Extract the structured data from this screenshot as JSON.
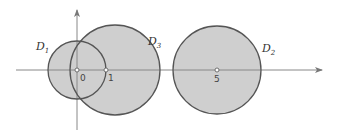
{
  "diagram": {
    "type": "disks-on-real-axis",
    "colors": {
      "fill": "#cfcfcf",
      "stroke": "#555555",
      "axis": "#888888",
      "background": "#ffffff"
    },
    "axes": {
      "origin_px": [
        77,
        70
      ],
      "unit_px": 28,
      "x_axis": {
        "from": 16,
        "to": 322
      },
      "y_axis": {
        "from": 10,
        "to": 130
      }
    },
    "disks": [
      {
        "name": "D1",
        "label": "D",
        "sub": "1",
        "center": 0,
        "radius": 1.05
      },
      {
        "name": "D3",
        "label": "D",
        "sub": "3",
        "center": 1.35,
        "radius": 1.6
      },
      {
        "name": "D2",
        "label": "D",
        "sub": "2",
        "center": 5,
        "radius": 1.55
      }
    ],
    "points": [
      {
        "value": 0,
        "label": "0"
      },
      {
        "value": 1,
        "label": "1"
      },
      {
        "value": 5,
        "label": "5"
      }
    ]
  }
}
